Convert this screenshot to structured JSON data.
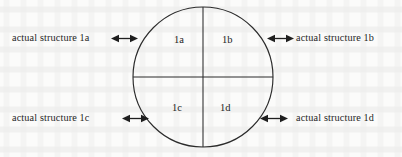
{
  "figure": {
    "background_color": "#fbfbfa",
    "ink_color": "#1f1f1f",
    "width": 402,
    "height": 157
  },
  "circle": {
    "center_x": 203,
    "center_y": 77,
    "radius": 70,
    "stroke_color": "#2b2b2b",
    "divider_orientation": "vertical-and-horizontal-diameters"
  },
  "quadrants": [
    {
      "id": "1a",
      "label": "1a",
      "position": "top-left"
    },
    {
      "id": "1b",
      "label": "1b",
      "position": "top-right"
    },
    {
      "id": "1c",
      "label": "1c",
      "position": "bottom-left"
    },
    {
      "id": "1d",
      "label": "1d",
      "position": "bottom-right"
    }
  ],
  "callouts": [
    {
      "id": "1a",
      "text": "actual structure 1a",
      "side": "left",
      "row": "top",
      "arrow": "double-headed-horizontal"
    },
    {
      "id": "1b",
      "text": "actual structure 1b",
      "side": "right",
      "row": "top",
      "arrow": "double-headed-horizontal"
    },
    {
      "id": "1c",
      "text": "actual structure 1c",
      "side": "left",
      "row": "bottom",
      "arrow": "double-headed-horizontal"
    },
    {
      "id": "1d",
      "text": "actual structure 1d",
      "side": "right",
      "row": "bottom",
      "arrow": "double-headed-horizontal"
    }
  ]
}
